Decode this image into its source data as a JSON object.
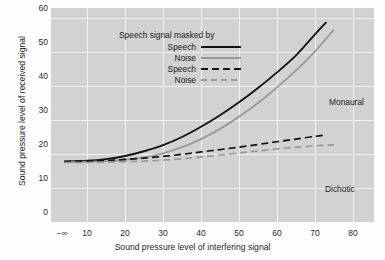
{
  "chart_data": {
    "type": "line",
    "title": "",
    "xlabel": "Sound pressure level of interfering signal",
    "ylabel": "Sound pressure level of received signal",
    "xlim": [
      0,
      85
    ],
    "ylim": [
      0,
      63
    ],
    "grid": true,
    "xticks": [
      "−∞",
      "10",
      "20",
      "30",
      "40",
      "50",
      "60",
      "70",
      "80"
    ],
    "xtick_values": [
      3,
      10,
      20,
      30,
      40,
      50,
      60,
      70,
      80
    ],
    "yticks": [
      "0",
      "10",
      "20",
      "30",
      "40",
      "50",
      "60"
    ],
    "ytick_values": [
      0,
      10,
      20,
      30,
      40,
      50,
      60
    ],
    "legend_title": "Speech signal masked by",
    "legend_position": "upper-left-inside",
    "series": [
      {
        "name": "Speech",
        "style": "solid",
        "color": "#121212",
        "group": "Monaural",
        "x": [
          4,
          10,
          15,
          20,
          25,
          30,
          35,
          40,
          45,
          50,
          55,
          60,
          65,
          70,
          73
        ],
        "y": [
          17.8,
          18.0,
          18.5,
          19.4,
          20.8,
          22.6,
          25.0,
          28.0,
          31.4,
          35.2,
          39.4,
          44.0,
          49.0,
          55.2,
          58.8
        ]
      },
      {
        "name": "Noise",
        "style": "solid",
        "color": "#9a9a9a",
        "group": "Monaural",
        "x": [
          4,
          10,
          15,
          20,
          25,
          30,
          35,
          40,
          45,
          50,
          55,
          60,
          65,
          70,
          75
        ],
        "y": [
          17.6,
          17.7,
          17.9,
          18.3,
          19.0,
          20.2,
          22.0,
          24.4,
          27.4,
          31.0,
          35.0,
          39.6,
          44.6,
          50.2,
          56.6
        ]
      },
      {
        "name": "Speech",
        "style": "dashed",
        "color": "#121212",
        "group": "Dichotic",
        "x": [
          4,
          10,
          15,
          20,
          25,
          30,
          35,
          40,
          45,
          50,
          55,
          60,
          65,
          70,
          73
        ],
        "y": [
          17.8,
          17.9,
          18.1,
          18.4,
          18.8,
          19.3,
          19.9,
          20.6,
          21.3,
          22.0,
          22.8,
          23.6,
          24.4,
          25.2,
          25.6
        ]
      },
      {
        "name": "Noise",
        "style": "dashed",
        "color": "#9a9a9a",
        "group": "Dichotic",
        "x": [
          4,
          10,
          15,
          20,
          25,
          30,
          35,
          40,
          45,
          50,
          55,
          60,
          65,
          70,
          75
        ],
        "y": [
          17.5,
          17.5,
          17.6,
          17.7,
          17.9,
          18.2,
          18.6,
          19.1,
          19.7,
          20.3,
          20.9,
          21.5,
          22.0,
          22.4,
          22.7
        ]
      }
    ],
    "annotations": [
      {
        "text": "Monaural",
        "x": 53,
        "y": 38.5
      },
      {
        "text": "Dichotic",
        "x": 52,
        "y": 14.0
      }
    ]
  },
  "legend": {
    "title": "Speech signal masked by",
    "entries": [
      {
        "label": "Speech",
        "style": "solid-black"
      },
      {
        "label": "Noise",
        "style": "solid-gray"
      },
      {
        "label": "Speech",
        "style": "dash-black"
      },
      {
        "label": "Noise",
        "style": "dash-gray"
      }
    ]
  },
  "colors": {
    "plot_background": "#d2d2d2",
    "gridline": "#f2f2f2",
    "series_primary": "#121212",
    "series_secondary": "#9a9a9a",
    "page_background": "#fdfdfd",
    "text": "#1f1f1f"
  }
}
